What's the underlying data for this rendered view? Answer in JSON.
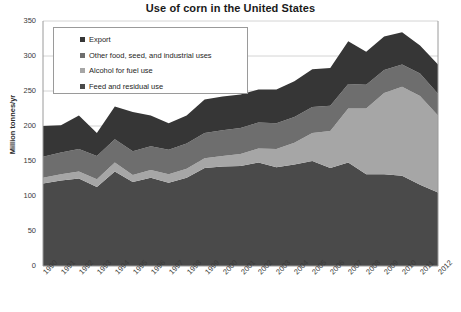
{
  "chart_data": {
    "type": "area",
    "title": "Use of corn in the United States",
    "xlabel": "",
    "ylabel": "Million tonnes/yr",
    "ylim": [
      0,
      350
    ],
    "yticks": [
      0,
      50,
      100,
      150,
      200,
      250,
      300,
      350
    ],
    "grid": true,
    "stacked": true,
    "legend_position": "upper-left-inside",
    "categories": [
      "1990",
      "1991",
      "1992",
      "1993",
      "1994",
      "1995",
      "1996",
      "1997",
      "1998",
      "1999",
      "2000",
      "2001",
      "2002",
      "2003",
      "2004",
      "2005",
      "2006",
      "2007",
      "2008",
      "2009",
      "2010",
      "2011",
      "2012"
    ],
    "series": [
      {
        "name": "Feed and residual use",
        "color": "#4a4a4a",
        "values": [
          118,
          122,
          125,
          113,
          135,
          120,
          126,
          119,
          126,
          140,
          142,
          143,
          148,
          141,
          145,
          150,
          140,
          148,
          131,
          131,
          129,
          116,
          105
        ]
      },
      {
        "name": "Alcohol for fuel use",
        "color": "#a6a6a6",
        "values": [
          8,
          9,
          10,
          11,
          13,
          10,
          11,
          12,
          13,
          14,
          15,
          17,
          20,
          26,
          31,
          40,
          53,
          77,
          94,
          116,
          127,
          127,
          110
        ]
      },
      {
        "name": "Other food, seed, and industrial uses",
        "color": "#6e6e6e",
        "values": [
          30,
          31,
          32,
          33,
          33,
          34,
          34,
          35,
          36,
          36,
          37,
          37,
          37,
          37,
          37,
          37,
          36,
          35,
          34,
          33,
          32,
          32,
          31
        ]
      },
      {
        "name": "Export",
        "color": "#363636",
        "values": [
          44,
          39,
          48,
          33,
          47,
          56,
          44,
          38,
          40,
          48,
          48,
          48,
          47,
          48,
          51,
          54,
          54,
          61,
          47,
          48,
          46,
          40,
          42
        ]
      }
    ],
    "legend": [
      {
        "label": "Export",
        "color": "#363636"
      },
      {
        "label": "Other food, seed, and industrial uses",
        "color": "#6e6e6e"
      },
      {
        "label": "Alcohol for fuel use",
        "color": "#a6a6a6"
      },
      {
        "label": "Feed and residual use",
        "color": "#4a4a4a"
      }
    ],
    "colors": {
      "export": "#363636",
      "other_food": "#6e6e6e",
      "alcohol": "#a6a6a6",
      "feed": "#4a4a4a",
      "gridline": "#d4d4d4",
      "axis": "#9a9a9a",
      "text": "#3a3a3a",
      "background": "#ffffff"
    }
  }
}
